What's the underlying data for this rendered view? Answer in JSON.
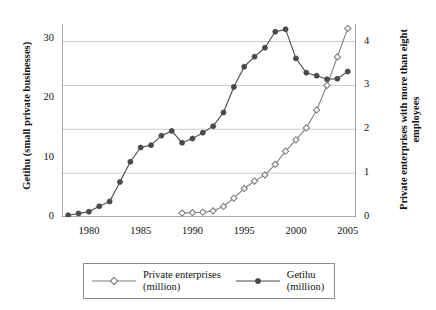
{
  "chart_data": {
    "type": "line",
    "title": "",
    "xlabel": "",
    "ylabel": "Getihu (small private businesses)",
    "ylabel_right": "Private enterprises with more than eight employees",
    "xlim": [
      1977.4,
      2005.8
    ],
    "ylim": [
      0,
      32.5
    ],
    "ylim_right": [
      0,
      4.4
    ],
    "xticks": [
      "1980",
      "1985",
      "1990",
      "1995",
      "2000",
      "2005"
    ],
    "xtick_values": [
      1980,
      1985,
      1990,
      1995,
      2000,
      2005
    ],
    "yticks_left": [
      "0",
      "10",
      "20",
      "30"
    ],
    "ytick_values_left": [
      0,
      10,
      20,
      30
    ],
    "yticks_right": [
      "0",
      "1",
      "2",
      "3",
      "4"
    ],
    "ytick_values_right": [
      0,
      1,
      2,
      3,
      4
    ],
    "grid": "horizontal-at-right-axis-ticks",
    "legend_position": "below-plot",
    "series": [
      {
        "name": "Private enterprises\n(million)",
        "legend_label": "Private enterprises",
        "legend_unit": "(million)",
        "axis": "right",
        "marker": "open-diamond",
        "color": "#7f7f7f",
        "x": [
          1989,
          1990,
          1991,
          1992,
          1993,
          1994,
          1995,
          1996,
          1997,
          1998,
          1999,
          2000,
          2001,
          2002,
          2003,
          2004,
          2005
        ],
        "values": [
          0.09,
          0.1,
          0.11,
          0.14,
          0.24,
          0.43,
          0.65,
          0.82,
          0.96,
          1.2,
          1.5,
          1.76,
          2.03,
          2.44,
          3.0,
          3.65,
          4.3
        ]
      },
      {
        "name": "Getihu\n(million)",
        "legend_label": "Getihu",
        "legend_unit": "(million)",
        "axis": "left",
        "marker": "filled-circle",
        "color": "#4a4a4a",
        "x": [
          1978,
          1979,
          1980,
          1981,
          1982,
          1983,
          1984,
          1985,
          1986,
          1987,
          1988,
          1989,
          1990,
          1991,
          1992,
          1993,
          1994,
          1995,
          1996,
          1997,
          1998,
          1999,
          2000,
          2001,
          2002,
          2003,
          2004,
          2005
        ],
        "values": [
          0.3,
          0.6,
          0.9,
          1.8,
          2.6,
          5.9,
          9.3,
          11.7,
          12.1,
          13.7,
          14.5,
          12.5,
          13.2,
          14.2,
          15.3,
          17.6,
          21.9,
          25.3,
          27.0,
          28.5,
          31.2,
          31.6,
          26.7,
          24.3,
          23.8,
          23.2,
          23.3,
          24.5
        ]
      }
    ]
  }
}
